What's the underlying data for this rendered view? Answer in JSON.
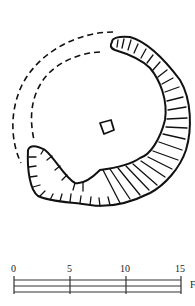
{
  "figure": {
    "type": "archaeological site plan",
    "features": {
      "embankment": "hachured curved bank",
      "missing_section": "dashed outline (conjectured)",
      "central_feature": "small square structure"
    },
    "colors": {
      "line": "#111111",
      "background": "#ffffff"
    }
  },
  "scale_bar": {
    "ticks": [
      "0",
      "5",
      "10",
      "15"
    ],
    "unit_label": "F"
  }
}
